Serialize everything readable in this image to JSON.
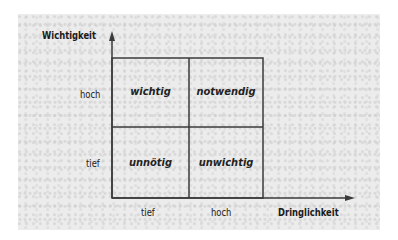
{
  "diagram": {
    "type": "eisenhower-matrix",
    "y_axis": {
      "title": "Wichtigkeit",
      "ticks": [
        "hoch",
        "tief"
      ]
    },
    "x_axis": {
      "title": "Dringlichkeit",
      "ticks": [
        "tief",
        "hoch"
      ]
    },
    "cells": {
      "top_left": "wichtig",
      "top_right": "notwendig",
      "bottom_left": "unnötig",
      "bottom_right": "unwichtig"
    },
    "colors": {
      "background": "#ececec",
      "lines": "#3a3a3a",
      "text": "#1a1a1a"
    }
  }
}
